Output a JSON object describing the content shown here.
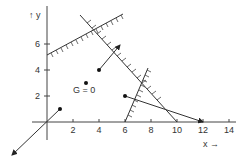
{
  "diagram": {
    "axes": {
      "x_label": "x →",
      "y_label": "↑ y",
      "x_ticks": [
        "2",
        "4",
        "6",
        "8",
        "10",
        "12",
        "14"
      ],
      "y_ticks": [
        "2",
        "4",
        "6"
      ]
    },
    "labels": {
      "g_zero": "G = 0"
    },
    "constraints": [
      {
        "name": "constraint-1",
        "from": [
          0,
          5
        ],
        "to": [
          6,
          8.2
        ],
        "hatch_side": "below"
      },
      {
        "name": "constraint-2",
        "from": [
          2.5,
          8.2
        ],
        "to": [
          10,
          0
        ],
        "hatch_side": "right"
      },
      {
        "name": "constraint-3",
        "from": [
          6,
          0
        ],
        "to": [
          7.8,
          4.2
        ],
        "hatch_side": "left"
      }
    ],
    "points": [
      {
        "label": "point-4-4",
        "x": 4,
        "y": 4
      },
      {
        "label": "point-3-3",
        "x": 3,
        "y": 3
      },
      {
        "label": "point-6-2",
        "x": 6,
        "y": 2
      },
      {
        "label": "point-1-1",
        "x": 1,
        "y": 1
      }
    ],
    "vectors": [
      {
        "from": [
          4,
          4
        ],
        "to": [
          5.6,
          5.9
        ]
      },
      {
        "from": [
          6,
          2
        ],
        "to": [
          12,
          0
        ]
      },
      {
        "from": [
          1,
          1
        ],
        "to": [
          -2.7,
          -2.5
        ]
      }
    ]
  }
}
